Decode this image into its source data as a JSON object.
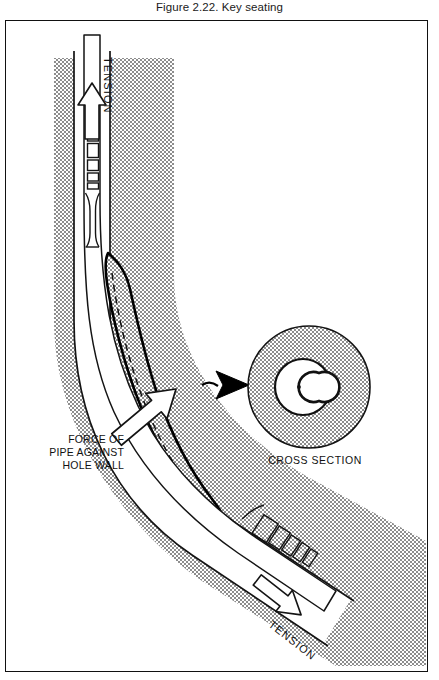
{
  "caption": "Figure 2.22. Key seating",
  "figure": {
    "labels": {
      "tension_top": "TENSION",
      "tension_bottom": "TENSION",
      "force_line1": "FORCE OF",
      "force_line2": "PIPE AGAINST",
      "force_line3": "HOLE WALL",
      "cross_section": "CROSS SECTION"
    },
    "colors": {
      "formation_gray": "#b4b4b4",
      "stipple_dark": "#6e6e6e",
      "outline_black": "#111111",
      "pipe_white": "#ffffff",
      "pointer_black": "#000000",
      "page_background": "#ffffff"
    },
    "elements": [
      {
        "name": "formation-rock-band",
        "kind": "stippled-band",
        "description": "gray stippled formation surrounding curved borehole"
      },
      {
        "name": "borehole-wall-left",
        "kind": "line"
      },
      {
        "name": "borehole-wall-right",
        "kind": "line"
      },
      {
        "name": "drill-pipe",
        "kind": "pipe",
        "description": "white drill pipe string curving from top to lower right"
      },
      {
        "name": "tool-joint-upper",
        "kind": "segmented-joint",
        "segments": 5
      },
      {
        "name": "tool-joint-lower",
        "kind": "segmented-joint",
        "segments": 5
      },
      {
        "name": "key-seat",
        "kind": "groove",
        "description": "elongated groove worn into the outer hole wall"
      },
      {
        "name": "key-seat-centerline",
        "kind": "dashed-line"
      },
      {
        "name": "tension-arrow-top",
        "kind": "hollow-arrow",
        "direction": "up"
      },
      {
        "name": "tension-arrow-bottom",
        "kind": "hollow-arrow",
        "direction": "down-right"
      },
      {
        "name": "force-arrow",
        "kind": "hollow-arrow",
        "direction": "up-right"
      },
      {
        "name": "callout-pointer",
        "kind": "solid-arrow",
        "direction": "right"
      },
      {
        "name": "cross-section-detail",
        "kind": "circle-detail",
        "description": "circular cross section showing keyhole shaped borehole with pipe in key seat"
      }
    ]
  }
}
